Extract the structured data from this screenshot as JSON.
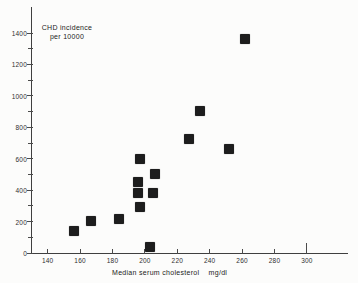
{
  "chart_data": {
    "type": "scatter",
    "title": "",
    "ylabel_line1": "CHD incidence",
    "ylabel_line2": "per 10000",
    "xlabel": "Median serum cholesterol",
    "x_unit": "mg/dl",
    "marker": "filled-square",
    "marker_color": "#1d1d1d",
    "axis_color": "#3f3f3f",
    "background_color": "#fcfcfb",
    "grid": "off",
    "legend": "none",
    "xlim": [
      130,
      326
    ],
    "ylim": [
      0,
      1560
    ],
    "x_ticks": [
      140,
      160,
      180,
      200,
      220,
      240,
      260,
      280,
      300
    ],
    "x_long_tick": 300,
    "y_ticks_labeled": [
      0,
      200,
      400,
      600,
      800,
      1000,
      1200,
      1400
    ],
    "y_ticks_minor": [
      100,
      300,
      500,
      700,
      900,
      1100,
      1300
    ],
    "points": [
      {
        "x": 156,
        "y": 140
      },
      {
        "x": 167,
        "y": 205
      },
      {
        "x": 184,
        "y": 215
      },
      {
        "x": 197,
        "y": 600
      },
      {
        "x": 196,
        "y": 450
      },
      {
        "x": 196,
        "y": 380
      },
      {
        "x": 197,
        "y": 290
      },
      {
        "x": 206,
        "y": 500
      },
      {
        "x": 205,
        "y": 385
      },
      {
        "x": 203,
        "y": 40
      },
      {
        "x": 227,
        "y": 725
      },
      {
        "x": 234,
        "y": 905
      },
      {
        "x": 252,
        "y": 665
      },
      {
        "x": 262,
        "y": 1360
      }
    ]
  }
}
